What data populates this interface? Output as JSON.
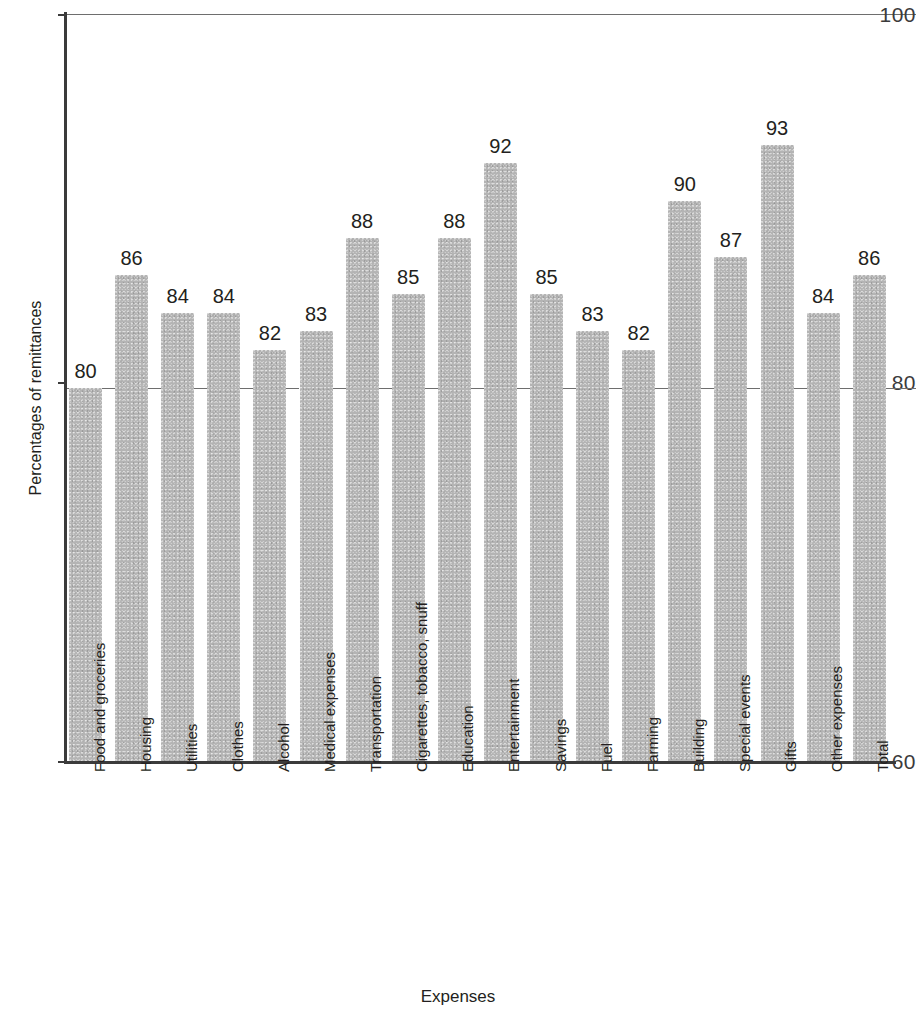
{
  "chart_data": {
    "type": "bar",
    "title": "",
    "xlabel": "Expenses",
    "ylabel": "Percentages of remittances",
    "ylim": [
      60,
      100
    ],
    "yticks": [
      60,
      80,
      100
    ],
    "ytick_labels": [
      "60",
      "80",
      "100"
    ],
    "gridlines": [
      80,
      100
    ],
    "grid": true,
    "legend": null,
    "bar_color": "#b4b4b4",
    "axis_color": "#3b3b3b",
    "categories": [
      "Food and groceries",
      "Housing",
      "Utilities",
      "Clothes",
      "Alcohol",
      "Medical expenses",
      "Transportation",
      "Cigarettes, tobacco, snuff",
      "Education",
      "Entertainment",
      "Savings",
      "Fuel",
      "Farming",
      "Building",
      "Special events",
      "Gifts",
      "Other expenses",
      "Total"
    ],
    "values": [
      80,
      86,
      84,
      84,
      82,
      83,
      88,
      85,
      88,
      92,
      85,
      83,
      82,
      90,
      87,
      93,
      84,
      86
    ],
    "value_labels": [
      "80",
      "86",
      "84",
      "84",
      "82",
      "83",
      "88",
      "85",
      "88",
      "92",
      "85",
      "83",
      "82",
      "90",
      "87",
      "93",
      "84",
      "86"
    ]
  }
}
